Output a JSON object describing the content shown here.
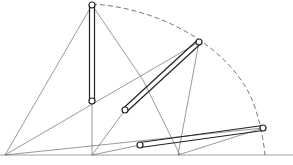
{
  "figure": {
    "type": "mechanism-diagram",
    "colors": {
      "background": "#ffffff",
      "line": "#444444",
      "rod": "#222222",
      "arc": "#555555"
    },
    "pivots": {
      "origin": {
        "x": 5,
        "y": 155
      },
      "base": {
        "x": 92,
        "y": 155
      }
    },
    "baseline": {
      "x1": 0,
      "x2": 293,
      "y": 155
    },
    "rods": [
      {
        "name": "rod-vertical",
        "top": {
          "x": 92,
          "y": 5
        },
        "bottom": {
          "x": 92,
          "y": 101
        }
      },
      {
        "name": "rod-diagonal",
        "top": {
          "x": 199,
          "y": 42
        },
        "bottom": {
          "x": 125,
          "y": 110
        }
      },
      {
        "name": "rod-horizontal",
        "top": {
          "x": 263,
          "y": 128
        },
        "bottom": {
          "x": 140,
          "y": 145
        }
      }
    ]
  }
}
